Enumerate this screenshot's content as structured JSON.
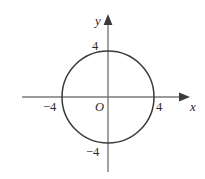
{
  "figure": {
    "type": "coordinate-plane-circle-graph",
    "background_color": "#ffffff",
    "axis_color": "#7a7a7a",
    "curve_color": "#3a3a3a",
    "label_color": "#2a2a2a"
  },
  "axes": {
    "x_axis_label": "x",
    "y_axis_label": "y",
    "origin_label": "O"
  },
  "ticks": {
    "x_positive": "4",
    "x_negative": "−4",
    "y_positive": "4",
    "y_negative": "−4"
  },
  "chart_data": {
    "type": "line",
    "title": "",
    "xlabel": "x",
    "ylabel": "y",
    "grid": false,
    "legend": null,
    "xlim": [
      -5.5,
      6.5
    ],
    "ylim": [
      -6.5,
      5.5
    ],
    "xticks": [
      -4,
      4
    ],
    "xticklabels": [
      "−4",
      "4"
    ],
    "yticks": [
      -4,
      4
    ],
    "yticklabels": [
      "−4",
      "4"
    ],
    "annotations": [
      "O"
    ],
    "series": [
      {
        "name": "circle",
        "shape": "circle",
        "center": [
          0,
          0
        ],
        "radius": 4,
        "equation": "x^2 + y^2 = 16",
        "closed": true
      }
    ],
    "geometry_px": {
      "origin": [
        108,
        97
      ],
      "radius_px": 46,
      "x_axis_from_px": [
        22,
        97
      ],
      "x_axis_to_px": [
        190,
        97
      ],
      "y_axis_from_px": [
        108,
        172
      ],
      "y_axis_to_px": [
        108,
        14
      ]
    }
  }
}
